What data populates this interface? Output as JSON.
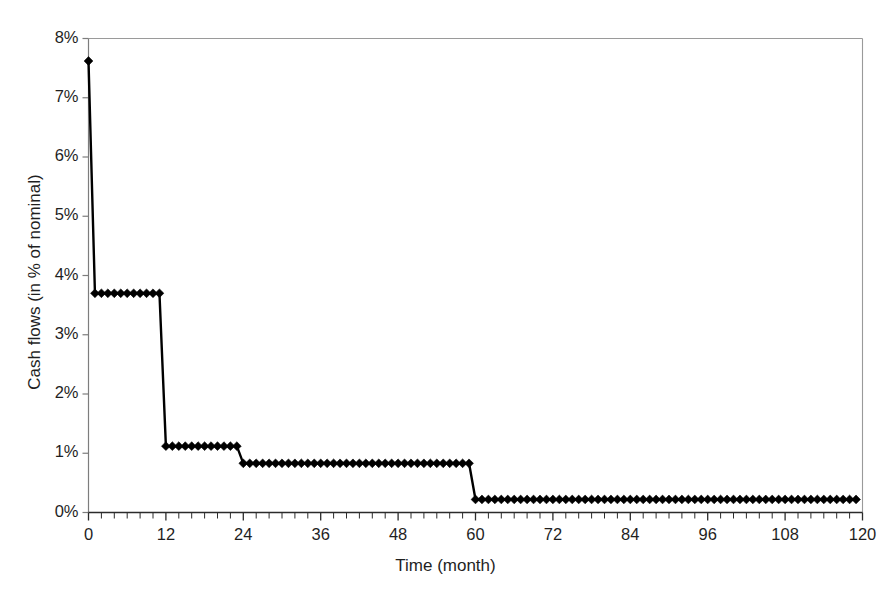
{
  "figure": {
    "top_cut_text": "",
    "background_color": "#ffffff",
    "series_color": "#000000",
    "frame_color": "#9a9a9a",
    "axis_color": "#7d7d7d"
  },
  "axes": {
    "x_title": "Time (month)",
    "y_title": "Cash flows (in % of nominal)",
    "x_ticks": [
      "0",
      "12",
      "24",
      "36",
      "48",
      "60",
      "72",
      "84",
      "96",
      "108",
      "120"
    ],
    "y_ticks": [
      "0%",
      "1%",
      "2%",
      "3%",
      "4%",
      "5%",
      "6%",
      "7%",
      "8%"
    ]
  },
  "chart_data": {
    "type": "line",
    "title": "",
    "subtitle": "",
    "xlabel": "Time (month)",
    "ylabel": "Cash flows (in % of nominal)",
    "xlim": [
      0,
      120
    ],
    "ylim": [
      0,
      8
    ],
    "x_tick_values": [
      0,
      12,
      24,
      36,
      48,
      60,
      72,
      84,
      96,
      108,
      120
    ],
    "y_tick_values": [
      0,
      1,
      2,
      3,
      4,
      5,
      6,
      7,
      8
    ],
    "x_minor_tick_interval": 2,
    "grid": false,
    "legend": "none",
    "marker": "diamond",
    "line_style": "solid",
    "units": "percent",
    "step_description": "Amortising cash-flow profile stepping down at months 12, 24 and 60",
    "steps": [
      {
        "start_month": 0,
        "end_month": 0,
        "value": 7.62
      },
      {
        "start_month": 1,
        "end_month": 11,
        "value": 3.7
      },
      {
        "start_month": 12,
        "end_month": 23,
        "value": 1.12
      },
      {
        "start_month": 24,
        "end_month": 59,
        "value": 0.83
      },
      {
        "start_month": 60,
        "end_month": 119,
        "value": 0.22
      }
    ],
    "x": [
      0,
      1,
      2,
      3,
      4,
      5,
      6,
      7,
      8,
      9,
      10,
      11,
      12,
      13,
      14,
      15,
      16,
      17,
      18,
      19,
      20,
      21,
      22,
      23,
      24,
      25,
      26,
      27,
      28,
      29,
      30,
      31,
      32,
      33,
      34,
      35,
      36,
      37,
      38,
      39,
      40,
      41,
      42,
      43,
      44,
      45,
      46,
      47,
      48,
      49,
      50,
      51,
      52,
      53,
      54,
      55,
      56,
      57,
      58,
      59,
      60,
      61,
      62,
      63,
      64,
      65,
      66,
      67,
      68,
      69,
      70,
      71,
      72,
      73,
      74,
      75,
      76,
      77,
      78,
      79,
      80,
      81,
      82,
      83,
      84,
      85,
      86,
      87,
      88,
      89,
      90,
      91,
      92,
      93,
      94,
      95,
      96,
      97,
      98,
      99,
      100,
      101,
      102,
      103,
      104,
      105,
      106,
      107,
      108,
      109,
      110,
      111,
      112,
      113,
      114,
      115,
      116,
      117,
      118,
      119
    ],
    "values": [
      7.62,
      3.7,
      3.7,
      3.7,
      3.7,
      3.7,
      3.7,
      3.7,
      3.7,
      3.7,
      3.7,
      3.7,
      1.12,
      1.12,
      1.12,
      1.12,
      1.12,
      1.12,
      1.12,
      1.12,
      1.12,
      1.12,
      1.12,
      1.12,
      0.83,
      0.83,
      0.83,
      0.83,
      0.83,
      0.83,
      0.83,
      0.83,
      0.83,
      0.83,
      0.83,
      0.83,
      0.83,
      0.83,
      0.83,
      0.83,
      0.83,
      0.83,
      0.83,
      0.83,
      0.83,
      0.83,
      0.83,
      0.83,
      0.83,
      0.83,
      0.83,
      0.83,
      0.83,
      0.83,
      0.83,
      0.83,
      0.83,
      0.83,
      0.83,
      0.83,
      0.22,
      0.22,
      0.22,
      0.22,
      0.22,
      0.22,
      0.22,
      0.22,
      0.22,
      0.22,
      0.22,
      0.22,
      0.22,
      0.22,
      0.22,
      0.22,
      0.22,
      0.22,
      0.22,
      0.22,
      0.22,
      0.22,
      0.22,
      0.22,
      0.22,
      0.22,
      0.22,
      0.22,
      0.22,
      0.22,
      0.22,
      0.22,
      0.22,
      0.22,
      0.22,
      0.22,
      0.22,
      0.22,
      0.22,
      0.22,
      0.22,
      0.22,
      0.22,
      0.22,
      0.22,
      0.22,
      0.22,
      0.22,
      0.22,
      0.22,
      0.22,
      0.22,
      0.22,
      0.22,
      0.22,
      0.22,
      0.22,
      0.22,
      0.22,
      0.22
    ]
  }
}
